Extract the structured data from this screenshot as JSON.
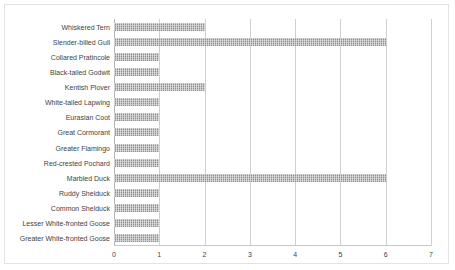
{
  "chart_data": {
    "type": "bar",
    "orientation": "horizontal",
    "title": "",
    "subtitle": "",
    "xlabel": "",
    "ylabel": "",
    "xlim": [
      0,
      7
    ],
    "ylim": null,
    "grid": true,
    "legend": null,
    "legend_position": "none",
    "xticks": [
      "0",
      "1",
      "2",
      "3",
      "4",
      "5",
      "6",
      "7"
    ],
    "xtick_values": [
      0,
      1,
      2,
      3,
      4,
      5,
      6,
      7
    ],
    "categories": [
      "Whiskered Tern",
      "Slender-billed Gull",
      "Collared Pratincole",
      "Black-tailed Godwit",
      "Kentish Plover",
      "White-tailed Lapwing",
      "Eurasian Coot",
      "Great Cormorant",
      "Greater Flamingo",
      "Red-crested Pochard",
      "Marbled Duck",
      "Ruddy Shelduck",
      "Common Shelduck",
      "Lesser White-fronted Goose",
      "Greater White-fronted Goose"
    ],
    "values": [
      2,
      6,
      1,
      1,
      2,
      1,
      1,
      1,
      1,
      1,
      6,
      1,
      1,
      1,
      1
    ],
    "series": [
      {
        "name": "",
        "values": [
          2,
          6,
          1,
          1,
          2,
          1,
          1,
          1,
          1,
          1,
          6,
          1,
          1,
          1,
          1
        ]
      }
    ],
    "colors": {
      "bar_fill": "#9a9a9a",
      "gridline": "#d0d0d0",
      "axis": "#b4b4b4",
      "text": "#3f3f3f",
      "frame_border": "#e3e3e3",
      "background": "#ffffff"
    }
  }
}
